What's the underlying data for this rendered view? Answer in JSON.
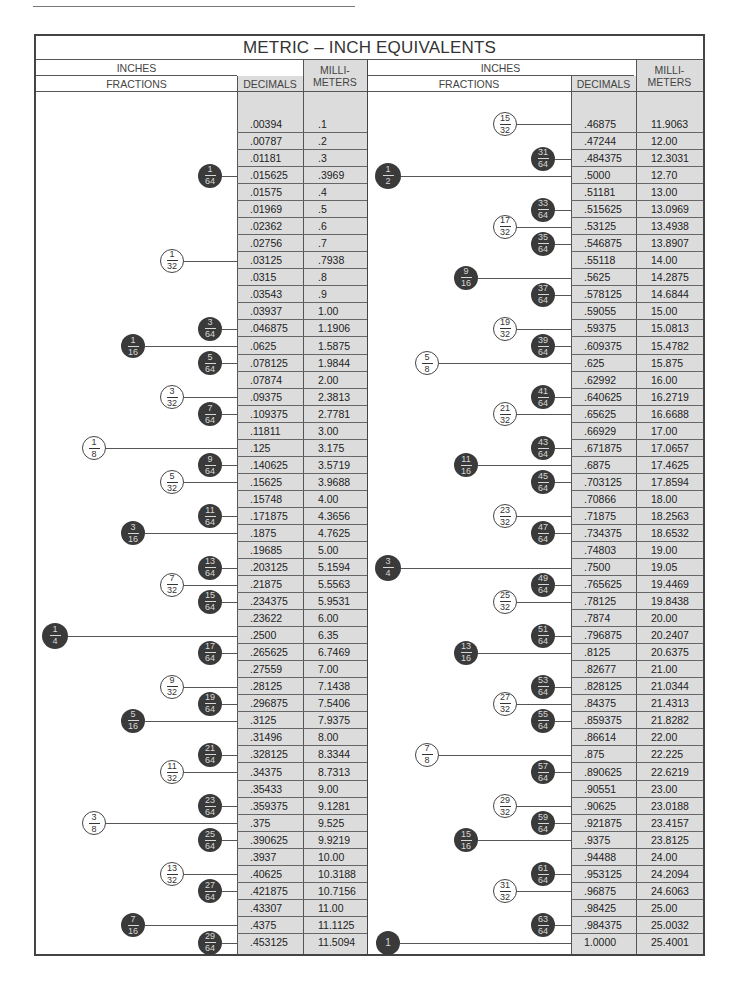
{
  "page": {
    "header_text": ""
  },
  "table": {
    "title": "METRIC – INCH EQUIVALENTS",
    "headers": {
      "inches": "INCHES",
      "fractions": "FRACTIONS",
      "decimals": "DECIMALS",
      "millimeters": "MILLI-\nMETERS"
    },
    "left_rows": [
      {
        "dec": ".00394",
        "mm": ".1"
      },
      {
        "dec": ".00787",
        "mm": ".2"
      },
      {
        "dec": ".01181",
        "mm": ".3"
      },
      {
        "dec": ".015625",
        "mm": ".3969",
        "frac": "1/64"
      },
      {
        "dec": ".01575",
        "mm": ".4"
      },
      {
        "dec": ".01969",
        "mm": ".5"
      },
      {
        "dec": ".02362",
        "mm": ".6"
      },
      {
        "dec": ".02756",
        "mm": ".7"
      },
      {
        "dec": ".03125",
        "mm": ".7938",
        "frac": "1/32"
      },
      {
        "dec": ".0315",
        "mm": ".8"
      },
      {
        "dec": ".03543",
        "mm": ".9"
      },
      {
        "dec": ".03937",
        "mm": "1.00"
      },
      {
        "dec": ".046875",
        "mm": "1.1906",
        "frac": "3/64"
      },
      {
        "dec": ".0625",
        "mm": "1.5875",
        "frac": "1/16"
      },
      {
        "dec": ".078125",
        "mm": "1.9844",
        "frac": "5/64"
      },
      {
        "dec": ".07874",
        "mm": "2.00"
      },
      {
        "dec": ".09375",
        "mm": "2.3813",
        "frac": "3/32"
      },
      {
        "dec": ".109375",
        "mm": "2.7781",
        "frac": "7/64"
      },
      {
        "dec": ".11811",
        "mm": "3.00"
      },
      {
        "dec": ".125",
        "mm": "3.175",
        "frac": "1/8"
      },
      {
        "dec": ".140625",
        "mm": "3.5719",
        "frac": "9/64"
      },
      {
        "dec": ".15625",
        "mm": "3.9688",
        "frac": "5/32"
      },
      {
        "dec": ".15748",
        "mm": "4.00"
      },
      {
        "dec": ".171875",
        "mm": "4.3656",
        "frac": "11/64"
      },
      {
        "dec": ".1875",
        "mm": "4.7625",
        "frac": "3/16"
      },
      {
        "dec": ".19685",
        "mm": "5.00"
      },
      {
        "dec": ".203125",
        "mm": "5.1594",
        "frac": "13/64"
      },
      {
        "dec": ".21875",
        "mm": "5.5563",
        "frac": "7/32"
      },
      {
        "dec": ".234375",
        "mm": "5.9531",
        "frac": "15/64"
      },
      {
        "dec": ".23622",
        "mm": "6.00"
      },
      {
        "dec": ".2500",
        "mm": "6.35",
        "frac": "1/4"
      },
      {
        "dec": ".265625",
        "mm": "6.7469",
        "frac": "17/64"
      },
      {
        "dec": ".27559",
        "mm": "7.00"
      },
      {
        "dec": ".28125",
        "mm": "7.1438",
        "frac": "9/32"
      },
      {
        "dec": ".296875",
        "mm": "7.5406",
        "frac": "19/64"
      },
      {
        "dec": ".3125",
        "mm": "7.9375",
        "frac": "5/16"
      },
      {
        "dec": ".31496",
        "mm": "8.00"
      },
      {
        "dec": ".328125",
        "mm": "8.3344",
        "frac": "21/64"
      },
      {
        "dec": ".34375",
        "mm": "8.7313",
        "frac": "11/32"
      },
      {
        "dec": ".35433",
        "mm": "9.00"
      },
      {
        "dec": ".359375",
        "mm": "9.1281",
        "frac": "23/64"
      },
      {
        "dec": ".375",
        "mm": "9.525",
        "frac": "3/8"
      },
      {
        "dec": ".390625",
        "mm": "9.9219",
        "frac": "25/64"
      },
      {
        "dec": ".3937",
        "mm": "10.00"
      },
      {
        "dec": ".40625",
        "mm": "10.3188",
        "frac": "13/32"
      },
      {
        "dec": ".421875",
        "mm": "10.7156",
        "frac": "27/64"
      },
      {
        "dec": ".43307",
        "mm": "11.00"
      },
      {
        "dec": ".4375",
        "mm": "11.1125",
        "frac": "7/16"
      },
      {
        "dec": ".453125",
        "mm": "11.5094",
        "frac": "29/64"
      }
    ],
    "right_rows": [
      {
        "dec": ".46875",
        "mm": "11.9063",
        "frac": "15/32"
      },
      {
        "dec": ".47244",
        "mm": "12.00"
      },
      {
        "dec": ".484375",
        "mm": "12.3031",
        "frac": "31/64"
      },
      {
        "dec": ".5000",
        "mm": "12.70",
        "frac": "1/2"
      },
      {
        "dec": ".51181",
        "mm": "13.00"
      },
      {
        "dec": ".515625",
        "mm": "13.0969",
        "frac": "33/64"
      },
      {
        "dec": ".53125",
        "mm": "13.4938",
        "frac": "17/32"
      },
      {
        "dec": ".546875",
        "mm": "13.8907",
        "frac": "35/64"
      },
      {
        "dec": ".55118",
        "mm": "14.00"
      },
      {
        "dec": ".5625",
        "mm": "14.2875",
        "frac": "9/16"
      },
      {
        "dec": ".578125",
        "mm": "14.6844",
        "frac": "37/64"
      },
      {
        "dec": ".59055",
        "mm": "15.00"
      },
      {
        "dec": ".59375",
        "mm": "15.0813",
        "frac": "19/32"
      },
      {
        "dec": ".609375",
        "mm": "15.4782",
        "frac": "39/64"
      },
      {
        "dec": ".625",
        "mm": "15.875",
        "frac": "5/8"
      },
      {
        "dec": ".62992",
        "mm": "16.00"
      },
      {
        "dec": ".640625",
        "mm": "16.2719",
        "frac": "41/64"
      },
      {
        "dec": ".65625",
        "mm": "16.6688",
        "frac": "21/32"
      },
      {
        "dec": ".66929",
        "mm": "17.00"
      },
      {
        "dec": ".671875",
        "mm": "17.0657",
        "frac": "43/64"
      },
      {
        "dec": ".6875",
        "mm": "17.4625",
        "frac": "11/16"
      },
      {
        "dec": ".703125",
        "mm": "17.8594",
        "frac": "45/64"
      },
      {
        "dec": ".70866",
        "mm": "18.00"
      },
      {
        "dec": ".71875",
        "mm": "18.2563",
        "frac": "23/32"
      },
      {
        "dec": ".734375",
        "mm": "18.6532",
        "frac": "47/64"
      },
      {
        "dec": ".74803",
        "mm": "19.00"
      },
      {
        "dec": ".7500",
        "mm": "19.05",
        "frac": "3/4"
      },
      {
        "dec": ".765625",
        "mm": "19.4469",
        "frac": "49/64"
      },
      {
        "dec": ".78125",
        "mm": "19.8438",
        "frac": "25/32"
      },
      {
        "dec": ".7874",
        "mm": "20.00"
      },
      {
        "dec": ".796875",
        "mm": "20.2407",
        "frac": "51/64"
      },
      {
        "dec": ".8125",
        "mm": "20.6375",
        "frac": "13/16"
      },
      {
        "dec": ".82677",
        "mm": "21.00"
      },
      {
        "dec": ".828125",
        "mm": "21.0344",
        "frac": "53/64"
      },
      {
        "dec": ".84375",
        "mm": "21.4313",
        "frac": "27/32"
      },
      {
        "dec": ".859375",
        "mm": "21.8282",
        "frac": "55/64"
      },
      {
        "dec": ".86614",
        "mm": "22.00"
      },
      {
        "dec": ".875",
        "mm": "22.225",
        "frac": "7/8"
      },
      {
        "dec": ".890625",
        "mm": "22.6219",
        "frac": "57/64"
      },
      {
        "dec": ".90551",
        "mm": "23.00"
      },
      {
        "dec": ".90625",
        "mm": "23.0188",
        "frac": "29/32"
      },
      {
        "dec": ".921875",
        "mm": "23.4157",
        "frac": "59/64"
      },
      {
        "dec": ".9375",
        "mm": "23.8125",
        "frac": "15/16"
      },
      {
        "dec": ".94488",
        "mm": "24.00"
      },
      {
        "dec": ".953125",
        "mm": "24.2094",
        "frac": "61/64"
      },
      {
        "dec": ".96875",
        "mm": "24.6063",
        "frac": "31/32"
      },
      {
        "dec": ".98425",
        "mm": "25.00"
      },
      {
        "dec": ".984375",
        "mm": "25.0032",
        "frac": "63/64"
      },
      {
        "dec": "1.0000",
        "mm": "25.4001",
        "frac": "1"
      }
    ]
  },
  "colors": {
    "shaded_cell": "#dcdcdc",
    "filled_badge": "#3a3a3a",
    "border": "#444444"
  }
}
